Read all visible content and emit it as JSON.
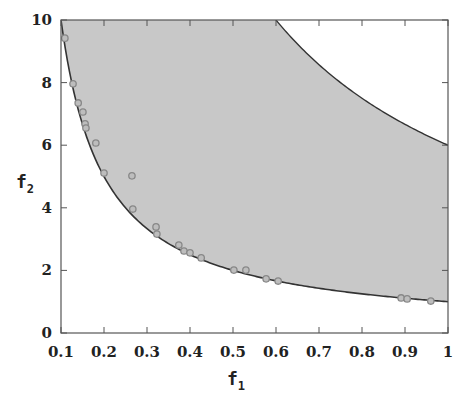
{
  "chart_data": {
    "type": "scatter",
    "title": "",
    "xlabel": "f",
    "xlabel_sub": "1",
    "ylabel": "f",
    "ylabel_sub": "2",
    "xlim": [
      0.1,
      1
    ],
    "ylim": [
      0,
      10
    ],
    "xticks": [
      "0.1",
      "0.2",
      "0.3",
      "0.4",
      "0.5",
      "0.6",
      "0.7",
      "0.8",
      "0.9",
      "1"
    ],
    "yticks": [
      "0",
      "2",
      "4",
      "6",
      "8",
      "10"
    ],
    "grid": false,
    "legend": null,
    "feasible_region": {
      "lower_boundary": "f2 = 1/f1",
      "upper_boundary": "f2 = 6/f1",
      "fill_color": "#c8c8c8",
      "line_color": "#333333"
    },
    "series": [
      {
        "name": "solutions",
        "marker": "open-circle",
        "color": "#888888",
        "points": [
          [
            0.109,
            9.42
          ],
          [
            0.128,
            7.96
          ],
          [
            0.14,
            7.35
          ],
          [
            0.151,
            7.06
          ],
          [
            0.156,
            6.68
          ],
          [
            0.158,
            6.55
          ],
          [
            0.181,
            6.07
          ],
          [
            0.2,
            5.11
          ],
          [
            0.265,
            5.02
          ],
          [
            0.267,
            3.96
          ],
          [
            0.321,
            3.39
          ],
          [
            0.323,
            3.16
          ],
          [
            0.374,
            2.81
          ],
          [
            0.386,
            2.62
          ],
          [
            0.4,
            2.56
          ],
          [
            0.426,
            2.4
          ],
          [
            0.502,
            2.01
          ],
          [
            0.53,
            2.01
          ],
          [
            0.577,
            1.73
          ],
          [
            0.605,
            1.66
          ],
          [
            0.891,
            1.12
          ],
          [
            0.905,
            1.09
          ],
          [
            0.96,
            1.02
          ]
        ]
      }
    ]
  }
}
